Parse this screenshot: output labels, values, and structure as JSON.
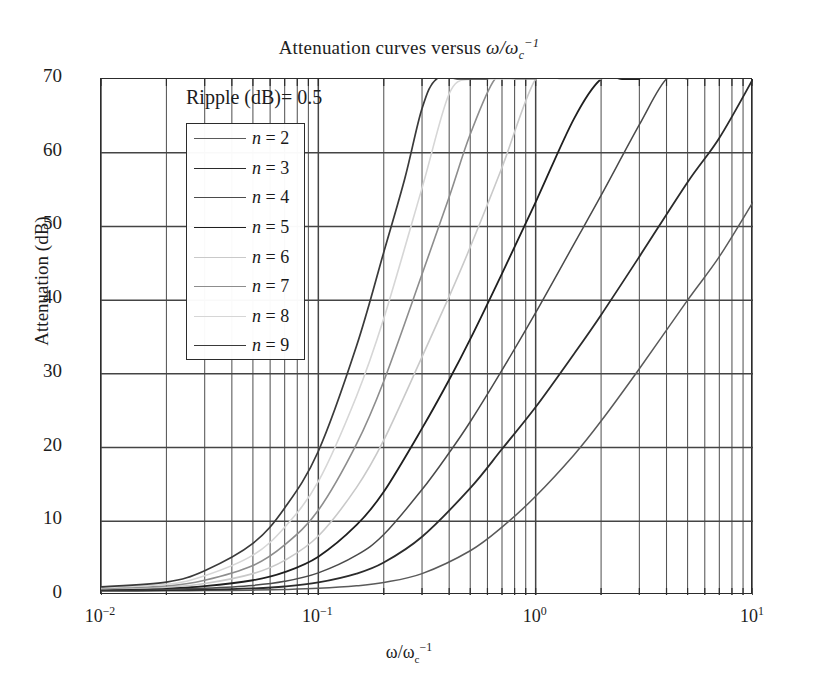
{
  "chart_data": {
    "type": "line",
    "title_parts": {
      "lead": "Attenuation curves versus ",
      "sym_w": "ω",
      "slash": "/",
      "sym_w2": "ω",
      "sub": "c",
      "sup": "−1"
    },
    "xlabel": "ω/ω_c^-1",
    "xlabel_parts": {
      "sym_w": "ω",
      "slash": "/",
      "sym_w2": "ω",
      "sub": "c",
      "sup": "−1"
    },
    "ylabel": "Attenuation (dB)",
    "xscale": "log",
    "yscale": "linear",
    "xlim": [
      0.01,
      10
    ],
    "ylim": [
      0,
      70
    ],
    "grid": "major-and-minor-log-x, major-y",
    "legend_position": "upper-left-inside",
    "annotation": "Ripple (dB)= 0.5",
    "ripple_db": 0.5,
    "x_ticks": [
      {
        "value": 0.01,
        "label_mantissa": "10",
        "label_exp": "−2"
      },
      {
        "value": 0.1,
        "label_mantissa": "10",
        "label_exp": "−1"
      },
      {
        "value": 1,
        "label_mantissa": "10",
        "label_exp": "0"
      },
      {
        "value": 10,
        "label_mantissa": "10",
        "label_exp": "1"
      }
    ],
    "y_ticks": [
      0,
      10,
      20,
      30,
      40,
      50,
      60,
      70
    ],
    "series": [
      {
        "name": "n = 2",
        "n": 2,
        "color": "#5a5a5a",
        "width": 1.5,
        "x": [
          0.01,
          0.02,
          0.03,
          0.05,
          0.07,
          0.1,
          0.15,
          0.2,
          0.3,
          0.5,
          0.7,
          1.0,
          1.5,
          2.0,
          3.0,
          5.0,
          7.0,
          10.0
        ],
        "y": [
          0.55,
          0.57,
          0.6,
          0.66,
          0.74,
          0.9,
          1.25,
          1.7,
          2.9,
          6.0,
          9.2,
          13.4,
          19.0,
          23.6,
          30.7,
          40.0,
          45.9,
          53.3
        ]
      },
      {
        "name": "n = 3",
        "n": 3,
        "color": "#2b2b2b",
        "width": 1.8,
        "x": [
          0.01,
          0.02,
          0.03,
          0.05,
          0.07,
          0.1,
          0.15,
          0.2,
          0.3,
          0.5,
          0.7,
          1.0,
          1.5,
          2.0,
          3.0,
          5.0,
          7.0,
          10.0
        ],
        "y": [
          0.62,
          0.66,
          0.72,
          0.9,
          1.15,
          1.7,
          2.9,
          4.4,
          7.9,
          14.5,
          19.8,
          25.5,
          32.7,
          38.0,
          45.9,
          56.0,
          62.0,
          70.0
        ]
      },
      {
        "name": "n = 4",
        "n": 4,
        "color": "#4a4a4a",
        "width": 1.5,
        "x": [
          0.01,
          0.02,
          0.03,
          0.05,
          0.07,
          0.1,
          0.15,
          0.2,
          0.3,
          0.4,
          0.5,
          0.7,
          1.0,
          1.5,
          2.0,
          3.0,
          4.0,
          5.0
        ],
        "y": [
          0.7,
          0.78,
          0.92,
          1.3,
          1.85,
          3.0,
          5.4,
          8.2,
          14.3,
          19.3,
          23.5,
          30.5,
          38.3,
          47.6,
          54.2,
          63.8,
          70.0,
          70.0
        ]
      },
      {
        "name": "n = 5",
        "n": 5,
        "color": "#1f1f1f",
        "width": 1.8,
        "x": [
          0.01,
          0.02,
          0.03,
          0.05,
          0.07,
          0.1,
          0.15,
          0.2,
          0.3,
          0.4,
          0.5,
          0.7,
          1.0,
          1.5,
          2.0,
          2.5,
          3.0
        ],
        "y": [
          0.78,
          0.92,
          1.2,
          2.0,
          3.1,
          5.2,
          9.5,
          14.0,
          22.6,
          29.2,
          34.7,
          43.6,
          53.3,
          64.6,
          70.0,
          70.0,
          70.0
        ]
      },
      {
        "name": "n = 6",
        "n": 6,
        "color": "#c9c9c9",
        "width": 1.6,
        "x": [
          0.01,
          0.02,
          0.03,
          0.05,
          0.07,
          0.1,
          0.15,
          0.2,
          0.3,
          0.4,
          0.5,
          0.7,
          1.0,
          1.3,
          1.6,
          2.0
        ],
        "y": [
          0.85,
          1.05,
          1.55,
          2.9,
          4.7,
          8.0,
          14.6,
          21.0,
          32.3,
          40.5,
          47.2,
          58.0,
          70.0,
          70.0,
          70.0,
          70.0
        ]
      },
      {
        "name": "n = 7",
        "n": 7,
        "color": "#8d8d8d",
        "width": 1.6,
        "x": [
          0.01,
          0.02,
          0.03,
          0.05,
          0.07,
          0.1,
          0.15,
          0.2,
          0.3,
          0.4,
          0.5,
          0.65,
          0.8,
          1.0
        ],
        "y": [
          0.92,
          1.22,
          2.0,
          4.0,
          6.8,
          11.5,
          20.5,
          29.0,
          43.5,
          54.0,
          62.5,
          70.0,
          70.0,
          70.0
        ]
      },
      {
        "name": "n = 8",
        "n": 8,
        "color": "#d6d6d6",
        "width": 1.6,
        "x": [
          0.01,
          0.02,
          0.03,
          0.05,
          0.07,
          0.1,
          0.15,
          0.2,
          0.3,
          0.4,
          0.5,
          0.6,
          0.8
        ],
        "y": [
          1.0,
          1.45,
          2.6,
          5.4,
          9.2,
          15.4,
          27.0,
          37.5,
          55.2,
          68.0,
          70.0,
          70.0,
          70.0
        ]
      },
      {
        "name": "n = 9",
        "n": 9,
        "color": "#3a3a3a",
        "width": 1.7,
        "x": [
          0.01,
          0.02,
          0.03,
          0.05,
          0.07,
          0.1,
          0.15,
          0.2,
          0.25,
          0.3,
          0.35,
          0.45,
          0.6
        ],
        "y": [
          1.1,
          1.75,
          3.3,
          7.0,
          11.8,
          19.5,
          33.8,
          46.5,
          56.5,
          66.0,
          70.0,
          70.0,
          70.0
        ]
      }
    ]
  },
  "legend": {
    "entries": [
      {
        "label_var": "n",
        "label_rest": " = 2"
      },
      {
        "label_var": "n",
        "label_rest": " = 3"
      },
      {
        "label_var": "n",
        "label_rest": " = 4"
      },
      {
        "label_var": "n",
        "label_rest": " = 5"
      },
      {
        "label_var": "n",
        "label_rest": " = 6"
      },
      {
        "label_var": "n",
        "label_rest": " = 7"
      },
      {
        "label_var": "n",
        "label_rest": " = 8"
      },
      {
        "label_var": "n",
        "label_rest": " = 9"
      }
    ]
  },
  "style": {
    "axis_color": "#2c2c2c",
    "major_grid_color": "#444444",
    "minor_grid_color": "#555555",
    "background": "#ffffff"
  }
}
